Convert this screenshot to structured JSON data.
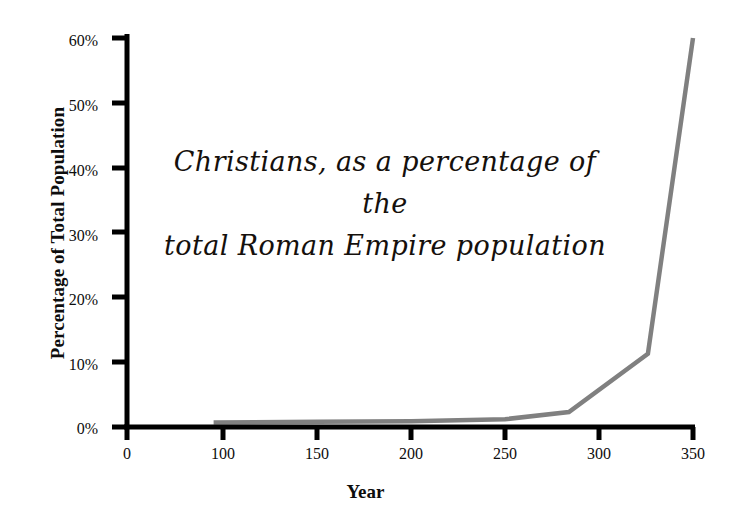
{
  "chart_data": {
    "type": "line",
    "title": "Christians, as a percentage of the total Roman Empire population",
    "title_lines": [
      "Christians, as a percentage of the",
      "total Roman Empire population"
    ],
    "xlabel": "Year",
    "ylabel": "Percentage of Total Population",
    "xlim": [
      100,
      350
    ],
    "ylim": [
      0,
      60
    ],
    "grid": false,
    "legend": null,
    "line_color": "#808080",
    "axis_color": "#000000",
    "x_tick_labels": [
      "0",
      "100",
      "150",
      "200",
      "250",
      "300",
      "350"
    ],
    "y_tick_labels": [
      "0%",
      "10%",
      "20%",
      "30%",
      "40%",
      "50%",
      "60%"
    ],
    "x_ticks": [
      0,
      100,
      150,
      200,
      250,
      300,
      350
    ],
    "y_ticks": [
      0,
      10,
      20,
      30,
      40,
      50,
      60
    ],
    "series": [
      {
        "name": "Christians as percentage of total Roman Empire population",
        "x": [
          95,
          150,
          200,
          250,
          284,
          326,
          350
        ],
        "values": [
          0.7,
          0.8,
          0.9,
          1.2,
          2.3,
          11.3,
          60.0
        ]
      }
    ]
  },
  "axis_geometry": {
    "origin_x_px": 127,
    "origin_y_px": 427,
    "x100_px": 223,
    "x350_px": 693,
    "y_top_px": 38
  }
}
